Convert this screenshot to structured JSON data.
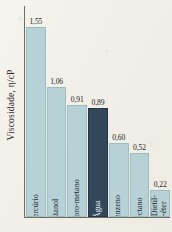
{
  "chart_data": {
    "type": "bar",
    "title": "",
    "xlabel": "",
    "ylabel": "Viscosidade, η/cP",
    "ylim": [
      0,
      1.72
    ],
    "grid": false,
    "legend": "none",
    "categories": [
      "Mercúrio",
      "Etanol",
      "Tetracloro-metano",
      "Água",
      "Benzeno",
      "Octano",
      "Dietil--éter"
    ],
    "values": [
      1.55,
      1.06,
      0.91,
      0.89,
      0.6,
      0.52,
      0.22
    ],
    "value_labels": [
      "1,55",
      "1,06",
      "0,91",
      "0,89",
      "0,60",
      "0,52",
      "0,22"
    ],
    "highlight_index": 3,
    "colors": {
      "bar": "#b6d2d6",
      "bar_border": "#9dbcc2",
      "highlight": "#32485a",
      "highlight_border": "#253745",
      "axis": "#6d6d68",
      "text": "#232323",
      "highlight_text": "#eef3f5",
      "background": "#f2efe8"
    }
  }
}
